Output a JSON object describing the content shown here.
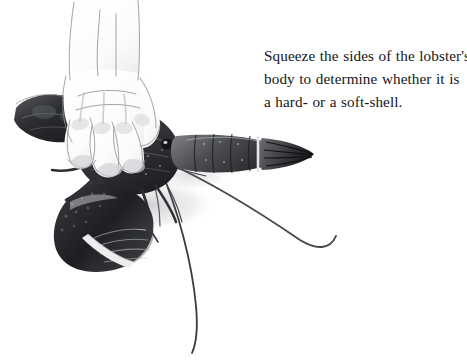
{
  "page": {
    "background_color": "#ffffff",
    "width": 467,
    "height": 363,
    "kind": "instructional-illustration"
  },
  "caption": {
    "text_color": "#15161a",
    "line1": "Squeeze the sides of the lobster's",
    "line2": "body to determine whether it is",
    "line3": "a hard- or a soft-shell.",
    "full_text": "Squeeze the sides of the lobster's body to determine whether it is a hard- or a soft-shell."
  },
  "illustration": {
    "title": "hand-squeezing-lobster-illustration",
    "medium": "grayscale pencil drawing",
    "colors": {
      "shell_dark": "#2b2b2e",
      "shell_mid": "#5e6064",
      "shell_light": "#b9bbbe",
      "highlight": "#f2f2f3",
      "skin_line": "#8d8f93",
      "skin_fill": "#fbfbfb",
      "antenna": "#3a3b3f",
      "shadow": "#d9dadc",
      "band_light": "#ededee"
    },
    "parts": {
      "hand": "human-hand-gripping-carapace",
      "carapace": "lobster-carapace",
      "eye": "lobster-eye",
      "claw_large": "lobster-large-claw-banded",
      "claw_small": "lobster-small-claw",
      "tail": "lobster-tail-segments",
      "tail_fan": "lobster-tail-fan",
      "antenna_right": "lobster-antenna-sweeping-right",
      "antenna_down": "lobster-antenna-curving-down",
      "legs": "lobster-walking-legs",
      "rubber_band": "claw-rubber-band"
    }
  }
}
